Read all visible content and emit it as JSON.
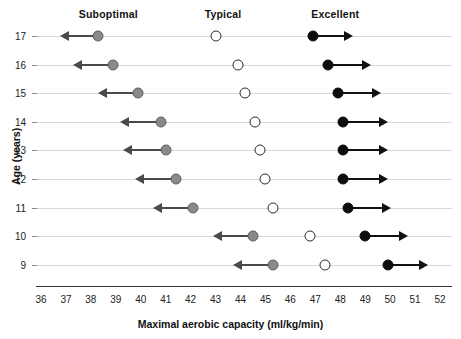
{
  "chart_data": {
    "type": "scatter",
    "title": "",
    "xlabel": "Maximal aerobic capacity (ml/kg/min)",
    "ylabel": "Age (years)",
    "xlim": [
      36,
      52
    ],
    "xticks": [
      36,
      37,
      38,
      39,
      40,
      41,
      42,
      43,
      44,
      45,
      46,
      47,
      48,
      49,
      50,
      51,
      52
    ],
    "yticks": [
      17,
      16,
      15,
      14,
      13,
      12,
      11,
      10,
      9
    ],
    "ylim": [
      8.5,
      17.5
    ],
    "grid": false,
    "legend_position": "top",
    "group_labels": [
      {
        "name": "Suboptimal",
        "x": 38.7
      },
      {
        "name": "Typical",
        "x": 43.3
      },
      {
        "name": "Excellent",
        "x": 47.8
      }
    ],
    "series": [
      {
        "name": "Suboptimal",
        "marker": "filled-gray-circle",
        "color": "#8a8a8a",
        "arrow": "left",
        "categories": [
          17,
          16,
          15,
          14,
          13,
          12,
          11,
          10,
          9
        ],
        "values": [
          38.3,
          38.9,
          39.9,
          40.8,
          41.0,
          41.4,
          42.1,
          44.5,
          45.3
        ],
        "arrow_ends": [
          36.9,
          37.4,
          38.4,
          39.3,
          39.4,
          39.9,
          40.6,
          43.0,
          43.8
        ]
      },
      {
        "name": "Typical",
        "marker": "open-circle",
        "color": "#ffffff",
        "arrow": "none",
        "categories": [
          17,
          16,
          15,
          14,
          13,
          12,
          11,
          10,
          9
        ],
        "values": [
          43.0,
          43.9,
          44.2,
          44.6,
          44.8,
          45.0,
          45.3,
          46.8,
          47.4
        ]
      },
      {
        "name": "Excellent",
        "marker": "filled-black-circle",
        "color": "#0d0d0d",
        "arrow": "right",
        "categories": [
          17,
          16,
          15,
          14,
          13,
          12,
          11,
          10,
          9
        ],
        "values": [
          46.9,
          47.5,
          47.9,
          48.1,
          48.1,
          48.1,
          48.3,
          49.0,
          49.9
        ],
        "arrow_ends": [
          48.4,
          49.1,
          49.5,
          49.8,
          49.8,
          49.8,
          49.9,
          50.6,
          51.4
        ]
      }
    ]
  }
}
